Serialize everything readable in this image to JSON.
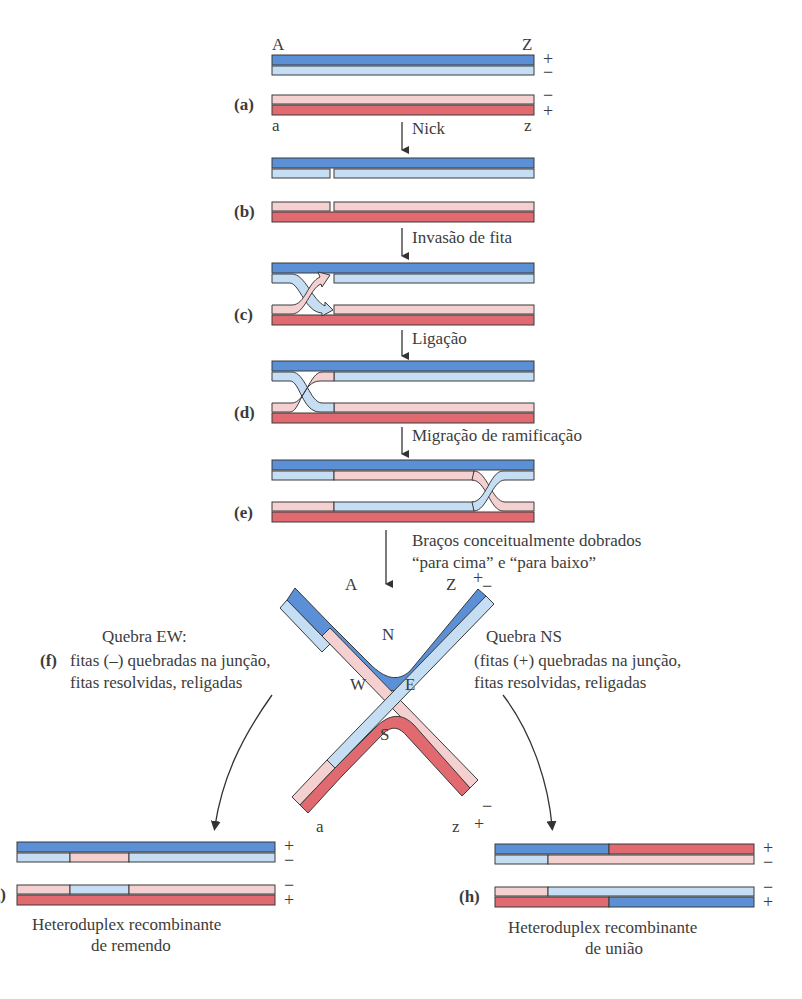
{
  "colors": {
    "dark_blue": "#5b8fd6",
    "light_blue": "#c6def3",
    "light_pink": "#f5d0d0",
    "dark_red": "#e06a70",
    "outline": "#3a3a3a",
    "text": "#3c3c3c"
  },
  "duplex_ends": {
    "top_left": "A",
    "top_right": "Z",
    "bottom_left": "a",
    "bottom_right": "z"
  },
  "strand_signs": {
    "top_upper": "+",
    "top_lower": "−",
    "bottom_upper": "−",
    "bottom_lower": "+"
  },
  "panels": {
    "a": "(a)",
    "b": "(b)",
    "c": "(c)",
    "d": "(d)",
    "e": "(e)",
    "f": "(f)",
    "g": "(g)",
    "h": "(h)"
  },
  "steps": {
    "nick": "Nick",
    "invasion": "Invasão de fita",
    "ligation": "Ligação",
    "branch_migration": "Migração de ramificação",
    "arms_bent_1": "Braços conceitualmente dobrados",
    "arms_bent_2": "“para cima” e “para baixo”"
  },
  "holliday": {
    "N": "N",
    "S": "S",
    "E": "E",
    "W": "W",
    "A": "A",
    "Z": "Z",
    "a": "a",
    "z": "z",
    "plus": "+",
    "minus": "−"
  },
  "ew_cleavage": {
    "title": "Quebra EW:",
    "line1": "fitas (–) quebradas na junção,",
    "line2": "fitas resolvidas, religadas"
  },
  "ns_cleavage": {
    "title": "Quebra NS",
    "line1": "(fitas (+) quebradas na junção,",
    "line2": "fitas resolvidas, religadas"
  },
  "products": {
    "patch_1": "Heteroduplex recombinante",
    "patch_2": "de remendo",
    "splice_1": "Heteroduplex recombinante",
    "splice_2": "de união"
  }
}
